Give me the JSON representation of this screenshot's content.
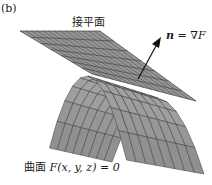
{
  "figure": {
    "panel_label": "(b)",
    "plane_label": "接平面",
    "normal_label": {
      "vector": "n",
      "equals": " = ∇",
      "func": "F"
    },
    "surface_label": {
      "prefix": "曲面 ",
      "equation": "F(x, y, z) = 0"
    },
    "colors": {
      "surface_fill": "#9a9a9a",
      "surface_edge": "#3a3a3a",
      "plane_fill": "#8c8c8c",
      "plane_grid": "#2a2a2a",
      "arrow": "#111111",
      "text": "#1a1a1a"
    },
    "elements": {
      "surface": "curved surface F(x,y,z)=0",
      "plane": "tangent plane",
      "arrow": "normal vector n = gradient F"
    }
  }
}
